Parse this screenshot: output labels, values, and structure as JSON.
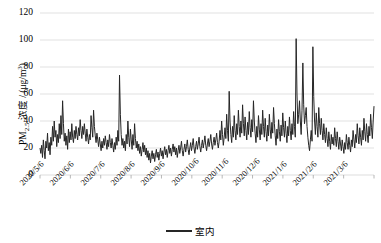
{
  "chart_data": {
    "type": "line",
    "title": "",
    "xlabel": "",
    "ylabel": "PM2.5 浓度 / (μg/m3)",
    "ylabel_parts": {
      "prefix": "PM",
      "sub": "2.5",
      "middle": " 浓度 / (μg/m",
      "sup": "3",
      "suffix": ")"
    },
    "ylim": [
      0,
      120
    ],
    "yticks": [
      0,
      20,
      40,
      60,
      80,
      100,
      120
    ],
    "ytick_labels": [
      "0",
      "20",
      "40",
      "60",
      "80",
      "100",
      "120"
    ],
    "grid": true,
    "grid_color": "#d9d9d9",
    "legend": {
      "position": "bottom-center",
      "entries": [
        {
          "name": "室内",
          "color": "#262626"
        }
      ]
    },
    "xtick_labels": [
      "2020/5/6",
      "2020/6/6",
      "2020/7/6",
      "2020/8/6",
      "2020/9/6",
      "2020/10/6",
      "2020/11/6",
      "2020/12/6",
      "2021/1/6",
      "2021/2/6",
      "2021/3/6"
    ],
    "x_start": "2020/5/6",
    "x_end": "2021/3/31",
    "series": [
      {
        "name": "室内",
        "color": "#262626",
        "line_width": 1,
        "values": [
          20,
          16,
          22,
          13,
          26,
          18,
          12,
          25,
          20,
          31,
          18,
          24,
          15,
          28,
          22,
          36,
          25,
          40,
          28,
          33,
          21,
          30,
          24,
          38,
          27,
          44,
          30,
          55,
          38,
          25,
          31,
          22,
          29,
          19,
          34,
          24,
          32,
          26,
          38,
          28,
          24,
          33,
          27,
          36,
          30,
          26,
          35,
          29,
          41,
          33,
          27,
          36,
          30,
          38,
          31,
          25,
          34,
          28,
          23,
          30,
          26,
          44,
          35,
          28,
          48,
          36,
          29,
          24,
          31,
          26,
          21,
          28,
          23,
          18,
          25,
          20,
          27,
          22,
          29,
          24,
          19,
          26,
          21,
          30,
          24,
          20,
          27,
          22,
          17,
          24,
          19,
          28,
          22,
          33,
          25,
          74,
          45,
          30,
          22,
          27,
          20,
          25,
          18,
          30,
          23,
          40,
          28,
          21,
          34,
          26,
          19,
          30,
          22,
          38,
          27,
          20,
          25,
          18,
          23,
          16,
          21,
          14,
          19,
          24,
          17,
          22,
          15,
          20,
          13,
          18,
          11,
          16,
          9,
          14,
          18,
          12,
          16,
          10,
          15,
          19,
          13,
          17,
          11,
          16,
          20,
          14,
          18,
          12,
          17,
          21,
          15,
          19,
          13,
          18,
          22,
          16,
          20,
          14,
          19,
          23,
          17,
          21,
          15,
          20,
          13,
          18,
          22,
          16,
          20,
          25,
          18,
          14,
          19,
          23,
          17,
          21,
          26,
          19,
          15,
          20,
          24,
          18,
          22,
          27,
          20,
          16,
          21,
          25,
          19,
          23,
          28,
          21,
          17,
          22,
          26,
          20,
          24,
          29,
          22,
          18,
          23,
          27,
          21,
          25,
          30,
          23,
          19,
          24,
          28,
          22,
          26,
          31,
          24,
          20,
          25,
          33,
          26,
          40,
          30,
          22,
          28,
          35,
          27,
          45,
          33,
          25,
          62,
          40,
          30,
          24,
          36,
          28,
          44,
          33,
          26,
          38,
          30,
          48,
          36,
          28,
          40,
          31,
          52,
          38,
          29,
          43,
          33,
          26,
          39,
          30,
          47,
          35,
          28,
          41,
          32,
          55,
          40,
          31,
          24,
          36,
          28,
          44,
          34,
          26,
          38,
          30,
          48,
          36,
          28,
          42,
          32,
          25,
          37,
          29,
          45,
          34,
          27,
          39,
          31,
          50,
          38,
          29,
          22,
          34,
          27,
          41,
          32,
          25,
          37,
          29,
          46,
          35,
          28,
          40,
          31,
          24,
          36,
          29,
          43,
          33,
          26,
          38,
          30,
          47,
          36,
          28,
          101,
          60,
          38,
          45,
          55,
          40,
          30,
          48,
          83,
          52,
          38,
          44,
          50,
          36,
          28,
          22,
          18,
          26,
          33,
          25,
          95,
          58,
          40,
          30,
          46,
          36,
          28,
          50,
          38,
          30,
          42,
          33,
          26,
          38,
          30,
          24,
          35,
          27,
          21,
          32,
          25,
          19,
          30,
          23,
          28,
          22,
          35,
          27,
          21,
          32,
          25,
          19,
          28,
          23,
          18,
          26,
          21,
          16,
          24,
          19,
          30,
          24,
          19,
          28,
          22,
          17,
          26,
          21,
          33,
          26,
          20,
          30,
          24,
          38,
          29,
          23,
          35,
          28,
          22,
          33,
          26,
          42,
          32,
          25,
          38,
          30,
          24,
          36,
          29,
          45,
          35,
          27,
          40,
          51
        ]
      }
    ]
  }
}
